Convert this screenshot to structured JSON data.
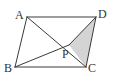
{
  "figure": {
    "type": "geometry",
    "points": {
      "A": {
        "label": "A"
      },
      "B": {
        "label": "B"
      },
      "C": {
        "label": "C"
      },
      "D": {
        "label": "D"
      },
      "P": {
        "label": "P"
      }
    },
    "segments": [
      [
        "A",
        "D"
      ],
      [
        "D",
        "C"
      ],
      [
        "C",
        "B"
      ],
      [
        "B",
        "A"
      ],
      [
        "A",
        "C"
      ],
      [
        "B",
        "P"
      ],
      [
        "P",
        "D"
      ]
    ],
    "shaded_region": {
      "vertices": [
        "P",
        "C",
        "D"
      ],
      "color": "#d4d4d4"
    },
    "line_color": "#3a3a3a",
    "label_color": "#333333"
  }
}
